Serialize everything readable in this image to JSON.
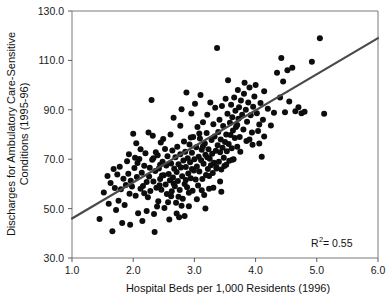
{
  "chart_data": {
    "type": "scatter",
    "title": "",
    "xlabel": "Hospital Beds per 1,000 Residents (1996)",
    "ylabel": "Discharges for Ambulatory Care-Sensitive Conditions (1995-96)",
    "ylabel_line1": "Discharges for Ambulatory Care-Sensitive",
    "ylabel_line2": "Conditions (1995-96)",
    "xlim": [
      1.0,
      6.0
    ],
    "ylim": [
      30.0,
      130.0
    ],
    "xticks": [
      1.0,
      2.0,
      3.0,
      4.0,
      5.0,
      6.0
    ],
    "yticks": [
      30.0,
      50.0,
      70.0,
      90.0,
      110.0,
      130.0
    ],
    "xtick_labels": [
      "1.0",
      "2.0",
      "3.0",
      "4.0",
      "5.0",
      "6.0"
    ],
    "ytick_labels": [
      "30.0",
      "50.0",
      "70.0",
      "90.0",
      "110.0",
      "130.0"
    ],
    "grid": false,
    "legend": null,
    "marker": "filled-circle",
    "marker_color": "#0d0d0d",
    "marker_size_px": 6,
    "annotations": [
      {
        "name": "r-squared",
        "text_prefix": "R",
        "text_superscript": "2",
        "text_suffix": " = 0.55",
        "full_text": "R2 = 0.55",
        "value": 0.55,
        "x": 5.0,
        "y": 36.0
      }
    ],
    "trendline": {
      "type": "linear-fit",
      "color": "#4a4a4a",
      "x_start": 1.0,
      "y_start": 46.0,
      "x_end": 6.0,
      "y_end": 119.0,
      "slope": 14.6,
      "intercept": 31.4
    },
    "points": [
      [
        1.45,
        45.8
      ],
      [
        1.52,
        56.5
      ],
      [
        1.58,
        63.2
      ],
      [
        1.6,
        52.0
      ],
      [
        1.63,
        60.4
      ],
      [
        1.66,
        40.8
      ],
      [
        1.68,
        66.0
      ],
      [
        1.7,
        58.3
      ],
      [
        1.72,
        49.4
      ],
      [
        1.74,
        63.8
      ],
      [
        1.76,
        53.2
      ],
      [
        1.78,
        66.9
      ],
      [
        1.8,
        57.8
      ],
      [
        1.82,
        44.2
      ],
      [
        1.84,
        62.1
      ],
      [
        1.86,
        51.5
      ],
      [
        1.88,
        59.6
      ],
      [
        1.9,
        69.2
      ],
      [
        1.92,
        64.1
      ],
      [
        1.94,
        56.0
      ],
      [
        1.95,
        43.5
      ],
      [
        1.96,
        61.3
      ],
      [
        1.98,
        58.9
      ],
      [
        2.0,
        80.3
      ],
      [
        2.02,
        66.4
      ],
      [
        2.04,
        55.2
      ],
      [
        2.06,
        62.8
      ],
      [
        2.08,
        48.1
      ],
      [
        2.1,
        70.1
      ],
      [
        2.12,
        58.0
      ],
      [
        2.14,
        64.5
      ],
      [
        2.15,
        45.0
      ],
      [
        2.16,
        59.2
      ],
      [
        2.18,
        67.3
      ],
      [
        2.2,
        72.4
      ],
      [
        2.22,
        60.8
      ],
      [
        2.24,
        54.6
      ],
      [
        2.26,
        63.0
      ],
      [
        2.28,
        57.1
      ],
      [
        2.3,
        94.0
      ],
      [
        2.31,
        69.8
      ],
      [
        2.32,
        79.5
      ],
      [
        2.33,
        61.0
      ],
      [
        2.34,
        47.8
      ],
      [
        2.35,
        40.5
      ],
      [
        2.36,
        65.2
      ],
      [
        2.38,
        58.4
      ],
      [
        2.4,
        71.6
      ],
      [
        2.41,
        53.0
      ],
      [
        2.42,
        66.2
      ],
      [
        2.44,
        62.0
      ],
      [
        2.45,
        76.8
      ],
      [
        2.46,
        57.6
      ],
      [
        2.48,
        69.0
      ],
      [
        2.5,
        63.5
      ],
      [
        2.51,
        50.2
      ],
      [
        2.52,
        74.1
      ],
      [
        2.53,
        59.8
      ],
      [
        2.54,
        67.4
      ],
      [
        2.55,
        55.9
      ],
      [
        2.56,
        71.2
      ],
      [
        2.58,
        64.0
      ],
      [
        2.59,
        45.6
      ],
      [
        2.6,
        61.5
      ],
      [
        2.61,
        80.0
      ],
      [
        2.62,
        68.3
      ],
      [
        2.63,
        57.0
      ],
      [
        2.64,
        73.5
      ],
      [
        2.65,
        62.6
      ],
      [
        2.66,
        86.8
      ],
      [
        2.67,
        66.1
      ],
      [
        2.68,
        59.0
      ],
      [
        2.69,
        70.8
      ],
      [
        2.7,
        52.4
      ],
      [
        2.71,
        64.8
      ],
      [
        2.72,
        75.0
      ],
      [
        2.73,
        61.2
      ],
      [
        2.74,
        68.0
      ],
      [
        2.75,
        46.5
      ],
      [
        2.76,
        57.5
      ],
      [
        2.77,
        72.0
      ],
      [
        2.78,
        66.6
      ],
      [
        2.79,
        90.2
      ],
      [
        2.8,
        63.1
      ],
      [
        2.81,
        54.0
      ],
      [
        2.82,
        69.5
      ],
      [
        2.83,
        77.2
      ],
      [
        2.84,
        60.0
      ],
      [
        2.85,
        73.0
      ],
      [
        2.86,
        66.8
      ],
      [
        2.87,
        97.0
      ],
      [
        2.88,
        58.6
      ],
      [
        2.89,
        70.4
      ],
      [
        2.9,
        64.2
      ],
      [
        2.91,
        51.0
      ],
      [
        2.92,
        76.0
      ],
      [
        2.93,
        68.8
      ],
      [
        2.94,
        62.3
      ],
      [
        2.95,
        88.5
      ],
      [
        2.96,
        72.6
      ],
      [
        2.97,
        57.2
      ],
      [
        2.98,
        79.0
      ],
      [
        2.99,
        65.4
      ],
      [
        3.0,
        70.0
      ],
      [
        3.01,
        92.5
      ],
      [
        3.02,
        61.8
      ],
      [
        3.03,
        74.8
      ],
      [
        3.04,
        67.0
      ],
      [
        3.05,
        83.0
      ],
      [
        3.06,
        59.4
      ],
      [
        3.07,
        71.0
      ],
      [
        3.08,
        65.0
      ],
      [
        3.09,
        78.4
      ],
      [
        3.1,
        96.0
      ],
      [
        3.11,
        69.6
      ],
      [
        3.12,
        73.8
      ],
      [
        3.13,
        62.0
      ],
      [
        3.14,
        85.0
      ],
      [
        3.15,
        68.2
      ],
      [
        3.16,
        55.5
      ],
      [
        3.17,
        76.4
      ],
      [
        3.18,
        71.8
      ],
      [
        3.19,
        63.6
      ],
      [
        3.2,
        80.6
      ],
      [
        3.21,
        88.0
      ],
      [
        3.22,
        66.0
      ],
      [
        3.23,
        74.0
      ],
      [
        3.24,
        58.0
      ],
      [
        3.25,
        70.2
      ],
      [
        3.26,
        93.0
      ],
      [
        3.27,
        67.6
      ],
      [
        3.28,
        77.8
      ],
      [
        3.29,
        72.2
      ],
      [
        3.3,
        64.4
      ],
      [
        3.31,
        84.2
      ],
      [
        3.32,
        68.6
      ],
      [
        3.33,
        79.2
      ],
      [
        3.34,
        90.8
      ],
      [
        3.35,
        73.4
      ],
      [
        3.36,
        66.2
      ],
      [
        3.37,
        115.0
      ],
      [
        3.38,
        75.6
      ],
      [
        3.39,
        81.0
      ],
      [
        3.4,
        69.0
      ],
      [
        3.41,
        86.0
      ],
      [
        3.42,
        72.8
      ],
      [
        3.43,
        78.0
      ],
      [
        3.44,
        65.8
      ],
      [
        3.45,
        91.5
      ],
      [
        3.46,
        74.6
      ],
      [
        3.47,
        83.4
      ],
      [
        3.48,
        70.6
      ],
      [
        3.49,
        67.2
      ],
      [
        3.5,
        77.0
      ],
      [
        3.51,
        94.5
      ],
      [
        3.52,
        80.0
      ],
      [
        3.53,
        73.2
      ],
      [
        3.54,
        88.4
      ],
      [
        3.55,
        102.0
      ],
      [
        3.56,
        76.2
      ],
      [
        3.57,
        69.4
      ],
      [
        3.58,
        84.8
      ],
      [
        3.59,
        79.8
      ],
      [
        3.6,
        92.0
      ],
      [
        3.61,
        74.4
      ],
      [
        3.62,
        87.0
      ],
      [
        3.63,
        81.6
      ],
      [
        3.64,
        70.0
      ],
      [
        3.65,
        95.0
      ],
      [
        3.66,
        78.6
      ],
      [
        3.67,
        89.6
      ],
      [
        3.68,
        83.0
      ],
      [
        3.7,
        75.0
      ],
      [
        3.71,
        98.0
      ],
      [
        3.72,
        86.4
      ],
      [
        3.73,
        91.0
      ],
      [
        3.74,
        79.0
      ],
      [
        3.75,
        73.0
      ],
      [
        3.76,
        93.8
      ],
      [
        3.78,
        88.0
      ],
      [
        3.8,
        82.0
      ],
      [
        3.81,
        96.5
      ],
      [
        3.82,
        101.0
      ],
      [
        3.84,
        90.0
      ],
      [
        3.85,
        77.4
      ],
      [
        3.86,
        85.2
      ],
      [
        3.88,
        93.0
      ],
      [
        3.9,
        99.0
      ],
      [
        3.92,
        87.8
      ],
      [
        3.94,
        80.8
      ],
      [
        3.95,
        75.8
      ],
      [
        3.96,
        91.2
      ],
      [
        3.98,
        95.4
      ],
      [
        4.0,
        100.0
      ],
      [
        4.02,
        88.6
      ],
      [
        4.04,
        81.4
      ],
      [
        4.06,
        76.4
      ],
      [
        4.08,
        92.8
      ],
      [
        4.1,
        71.0
      ],
      [
        4.12,
        86.0
      ],
      [
        4.14,
        97.5
      ],
      [
        4.2,
        90.4
      ],
      [
        4.25,
        83.6
      ],
      [
        4.3,
        88.8
      ],
      [
        4.35,
        105.0
      ],
      [
        4.4,
        95.0
      ],
      [
        4.42,
        111.0
      ],
      [
        4.45,
        101.5
      ],
      [
        4.48,
        89.0
      ],
      [
        4.52,
        106.0
      ],
      [
        4.55,
        93.4
      ],
      [
        4.6,
        107.0
      ],
      [
        4.65,
        89.4
      ],
      [
        4.7,
        91.0
      ],
      [
        4.75,
        88.6
      ],
      [
        4.8,
        89.2
      ],
      [
        4.92,
        109.5
      ],
      [
        5.05,
        119.0
      ],
      [
        5.12,
        88.4
      ],
      [
        2.05,
        76.5
      ],
      [
        2.07,
        68.5
      ],
      [
        2.12,
        74.0
      ],
      [
        2.25,
        80.8
      ],
      [
        2.27,
        66.5
      ],
      [
        2.37,
        72.8
      ],
      [
        2.43,
        59.5
      ],
      [
        2.47,
        63.4
      ],
      [
        2.49,
        78.2
      ],
      [
        2.57,
        52.6
      ],
      [
        2.71,
        48.0
      ],
      [
        2.74,
        54.8
      ],
      [
        2.79,
        51.2
      ],
      [
        2.84,
        47.0
      ],
      [
        2.91,
        56.4
      ],
      [
        3.04,
        53.8
      ],
      [
        3.12,
        57.4
      ],
      [
        3.18,
        50.0
      ],
      [
        3.24,
        63.2
      ],
      [
        3.31,
        58.4
      ],
      [
        3.36,
        66.8
      ],
      [
        3.42,
        61.0
      ],
      [
        3.08,
        80.4
      ],
      [
        3.14,
        75.2
      ],
      [
        3.21,
        70.8
      ],
      [
        1.93,
        72.0
      ],
      [
        2.03,
        70.6
      ],
      [
        2.18,
        56.2
      ],
      [
        2.33,
        70.4
      ],
      [
        2.39,
        50.8
      ],
      [
        2.66,
        60.2
      ],
      [
        2.86,
        61.6
      ],
      [
        2.94,
        78.8
      ],
      [
        3.44,
        56.8
      ],
      [
        3.52,
        67.8
      ],
      [
        3.62,
        69.8
      ],
      [
        3.7,
        83.8
      ],
      [
        3.9,
        78.0
      ],
      [
        4.06,
        84.0
      ],
      [
        4.14,
        79.2
      ],
      [
        2.22,
        49.0
      ],
      [
        2.44,
        67.8
      ],
      [
        2.62,
        55.0
      ],
      [
        2.77,
        83.5
      ],
      [
        2.96,
        66.0
      ]
    ]
  }
}
